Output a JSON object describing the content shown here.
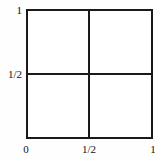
{
  "figure": {
    "colors": {
      "line": "#1a1a1a",
      "background": "#ffffff",
      "text": "#111111"
    }
  },
  "chart_data": {
    "type": "diagram",
    "title": "",
    "xlabel": "",
    "ylabel": "",
    "xlim": [
      0,
      1
    ],
    "ylim": [
      0,
      1
    ],
    "grid": true,
    "x_ticks": [
      {
        "value": 0,
        "label": "0"
      },
      {
        "value": 0.5,
        "label": "1/2"
      },
      {
        "value": 1,
        "label": "1"
      }
    ],
    "y_ticks": [
      {
        "value": 0.5,
        "label": "1/2"
      },
      {
        "value": 1,
        "label": "1"
      }
    ],
    "shapes": [
      {
        "name": "unit-square",
        "type": "rect",
        "x": 0,
        "y": 0,
        "width": 1,
        "height": 1
      },
      {
        "name": "vertical-midline",
        "type": "line",
        "x1": 0.5,
        "y1": 0,
        "x2": 0.5,
        "y2": 1
      },
      {
        "name": "horizontal-midline",
        "type": "line",
        "x1": 0,
        "y1": 0.5,
        "x2": 1,
        "y2": 0.5
      }
    ],
    "legend": [],
    "annotations": []
  }
}
